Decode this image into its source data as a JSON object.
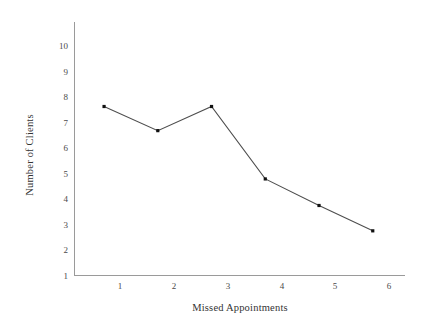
{
  "chart_data": {
    "type": "line",
    "title": "",
    "subtitle": "",
    "xlabel": "Missed Appointments",
    "ylabel": "Number of Clients",
    "x": [
      1,
      2,
      3,
      4,
      5,
      6
    ],
    "values": [
      7,
      6,
      7,
      4,
      2.9,
      1.85
    ],
    "categories": [
      "1",
      "2",
      "3",
      "4",
      "5",
      "6"
    ],
    "xtick_labels": [
      "1",
      "2",
      "3",
      "4",
      "5",
      "6"
    ],
    "ytick_labels": [
      "1",
      "2",
      "3",
      "4",
      "5",
      "6",
      "7",
      "8",
      "9",
      "10"
    ],
    "ytick_values": [
      1,
      2,
      3,
      4,
      5,
      6,
      7,
      8,
      9,
      10
    ],
    "xlim": [
      0.45,
      6.6
    ],
    "ylim": [
      0,
      10.5
    ],
    "grid": false,
    "legend": false,
    "legend_position": "none",
    "marker": "square",
    "series": [
      {
        "name": "Number of Clients",
        "values": [
          7,
          6,
          7,
          4,
          2.9,
          1.85
        ]
      }
    ],
    "colors": {
      "line": "#4d4d4d",
      "marker": "#111111",
      "axis": "#9a9a9a",
      "text": "#333333",
      "background": "#ffffff"
    }
  }
}
